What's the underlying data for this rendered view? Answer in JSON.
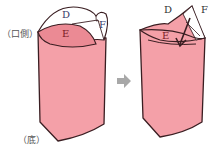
{
  "labels": {
    "mouth_side": "（口側）",
    "bottom": "（底）"
  },
  "left_figure": {
    "regions": [
      "D",
      "E",
      "F"
    ]
  },
  "right_figure": {
    "regions": [
      "D",
      "E",
      "F"
    ]
  },
  "colors": {
    "pink": "#f4a0a8",
    "pink_inner": "#eb8a94",
    "outline": "#3a1e22",
    "arrow_gray": "#a8a8a8",
    "white": "#ffffff"
  }
}
